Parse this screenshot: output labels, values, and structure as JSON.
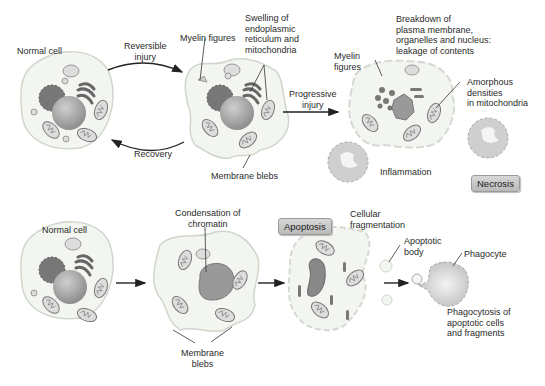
{
  "top_row": {
    "normal_cell": "Normal cell",
    "reversible_injury": "Reversible\ninjury",
    "recovery": "Recovery",
    "myelin_figures": "Myelin figures",
    "swelling": "Swelling of\nendoplasmic\nreticulum and\nmitochondria",
    "membrane_blebs": "Membrane blebs",
    "progressive_injury": "Progressive\ninjury",
    "breakdown": "Breakdown of\nplasma membrane,\norganelles and nucleus:\nleakage of contents",
    "myelin_figures_2": "Myelin\nfigures",
    "amorphous": "Amorphous\ndensities\nin mitochondria",
    "inflammation": "Inflammation",
    "necrosis_badge": "Necrosis"
  },
  "bottom_row": {
    "normal_cell": "Normal cell",
    "condensation": "Condensation of\nchromatin",
    "membrane_blebs": "Membrane\nblebs",
    "apoptosis_badge": "Apoptosis",
    "cellular_fragmentation": "Cellular\nfragmentation",
    "apoptotic_body": "Apoptotic\nbody",
    "phagocyte": "Phagocyte",
    "phagocytosis": "Phagocytosis of\napoptotic cells\nand fragments"
  },
  "colors": {
    "cell_fill": "#f3f5f0",
    "cell_stroke": "#cfd6cc",
    "nucleus": "#a8a8a8",
    "organelle": "#8a8a8a",
    "badge_bg": "#c6c6c6"
  }
}
